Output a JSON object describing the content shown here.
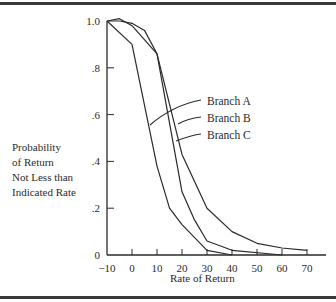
{
  "chart_data": {
    "type": "line",
    "title": "",
    "xlabel": "Rate of Return",
    "ylabel": [
      "Probability",
      "of Return",
      "Not Less than",
      "Indicated Rate"
    ],
    "xlim": [
      -10,
      75
    ],
    "ylim": [
      0,
      1.0
    ],
    "x_ticks": [
      -10,
      0,
      10,
      20,
      30,
      40,
      50,
      60,
      70
    ],
    "x_tick_labels": [
      "−10",
      "0",
      "10",
      "20",
      "30",
      "40",
      "50",
      "60",
      "70"
    ],
    "y_ticks": [
      0,
      0.2,
      0.4,
      0.6,
      0.8,
      1.0
    ],
    "y_tick_labels": [
      "0",
      ".2",
      ".4",
      ".6",
      ".8",
      "1.0"
    ],
    "grid": false,
    "legend_position": "inline leader labels, right of curves",
    "series": [
      {
        "name": "Branch A",
        "x": [
          -10,
          0,
          10,
          15,
          20,
          30,
          40
        ],
        "values": [
          1.0,
          0.9,
          0.38,
          0.2,
          0.13,
          0.02,
          0.0
        ]
      },
      {
        "name": "Branch B",
        "x": [
          -10,
          -5,
          0,
          5,
          10,
          20,
          25,
          30,
          40,
          60
        ],
        "values": [
          1.0,
          1.0,
          0.99,
          0.96,
          0.86,
          0.27,
          0.15,
          0.06,
          0.02,
          0.0
        ]
      },
      {
        "name": "Branch C",
        "x": [
          -10,
          -5,
          0,
          10,
          20,
          30,
          40,
          50,
          60,
          70
        ],
        "values": [
          1.0,
          1.01,
          0.98,
          0.86,
          0.43,
          0.2,
          0.1,
          0.05,
          0.03,
          0.02
        ]
      }
    ]
  },
  "labels": {
    "xlabel": "Rate of Return",
    "ylabel_lines": [
      "Probability",
      "of Return",
      "Not Less than",
      "Indicated Rate"
    ],
    "legend": [
      "Branch A",
      "Branch B",
      "Branch C"
    ]
  },
  "colors": {
    "ink": "#2a2a2a",
    "frame": "#3a3a3a",
    "background": "#ffffff"
  }
}
